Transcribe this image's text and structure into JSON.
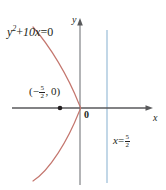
{
  "figure": {
    "type": "coordinate-plane-graph",
    "width": 166,
    "height": 190,
    "background": "#ffffff"
  },
  "axes": {
    "x_label": "x",
    "y_label": "y",
    "origin_label": "0",
    "x_axis": {
      "y_pixel": 108,
      "x_start": 12,
      "x_end": 152,
      "arrow": "right",
      "color": "#58595b"
    },
    "y_axis": {
      "x_pixel": 80,
      "y_start": 20,
      "y_end": 185,
      "arrow": "up",
      "color": "#8a8c8e"
    }
  },
  "curve": {
    "equation_parts": {
      "var_y": "y",
      "exponent": "2",
      "plus": "+",
      "coefficient_term": "10x",
      "equals": "=",
      "rhs": "0"
    },
    "equation_text": "y² + 10x = 0",
    "color": "#c4766e",
    "vertex": {
      "x": 0,
      "y": 0
    },
    "opens": "left",
    "latus_rectum_x": -2.5
  },
  "point": {
    "label_parts": {
      "open_paren": "(",
      "minus": "−",
      "numerator": "5",
      "denominator": "2",
      "comma": ", ",
      "y_value": "0",
      "close_paren": ")"
    },
    "label_text": "(−5/2, 0)",
    "x": -2.5,
    "y": 0,
    "marker_color": "#231f20"
  },
  "directrix": {
    "label_parts": {
      "var": "x",
      "equals": "=",
      "numerator": "5",
      "denominator": "2"
    },
    "label_text": "x = 5/2",
    "value": 2.5,
    "color": "#a8c6dd",
    "x_pixel": 107
  }
}
